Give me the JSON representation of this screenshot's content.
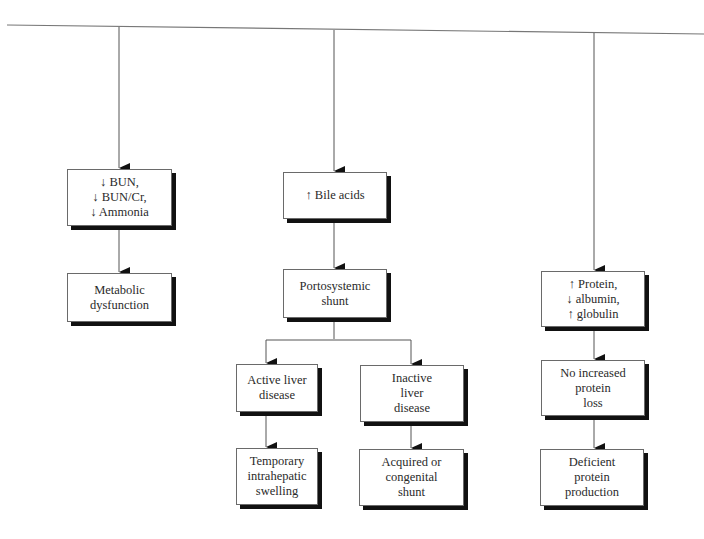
{
  "diagram": {
    "type": "flowchart",
    "branches": [
      {
        "id": "left",
        "nodes": [
          {
            "id": "bun",
            "label": "↓ BUN,\n↓ BUN/Cr,\n↓ Ammonia"
          },
          {
            "id": "metabolic",
            "label": "Metabolic\ndysfunction"
          }
        ]
      },
      {
        "id": "middle",
        "nodes": [
          {
            "id": "bile",
            "label": "↑ Bile acids"
          },
          {
            "id": "portosystemic",
            "label": "Portosystemic\nshunt"
          },
          {
            "id": "active",
            "label": "Active liver\ndisease"
          },
          {
            "id": "inactive",
            "label": "Inactive\nliver\ndisease"
          },
          {
            "id": "temporary",
            "label": "Temporary\nintrahepatic\nswelling"
          },
          {
            "id": "acquired",
            "label": "Acquired or\ncongenital\nshunt"
          }
        ]
      },
      {
        "id": "right",
        "nodes": [
          {
            "id": "protein",
            "label": "↑ Protein,\n↓ albumin,\n↑ globulin"
          },
          {
            "id": "noloss",
            "label": "No increased\nprotein\nloss"
          },
          {
            "id": "deficient",
            "label": "Deficient\nprotein\nproduction"
          }
        ]
      }
    ],
    "edges": [
      {
        "from": "top-line",
        "to": "bun"
      },
      {
        "from": "bun",
        "to": "metabolic"
      },
      {
        "from": "top-line",
        "to": "bile"
      },
      {
        "from": "bile",
        "to": "portosystemic"
      },
      {
        "from": "portosystemic",
        "to": "active"
      },
      {
        "from": "portosystemic",
        "to": "inactive"
      },
      {
        "from": "active",
        "to": "temporary"
      },
      {
        "from": "inactive",
        "to": "acquired"
      },
      {
        "from": "top-line",
        "to": "protein"
      },
      {
        "from": "protein",
        "to": "noloss"
      },
      {
        "from": "noloss",
        "to": "deficient"
      }
    ],
    "colors": {
      "line": "#555555",
      "box_border": "#6a6a6a",
      "shadow": "#111111",
      "text": "#2a2a2a",
      "background": "#ffffff"
    }
  }
}
